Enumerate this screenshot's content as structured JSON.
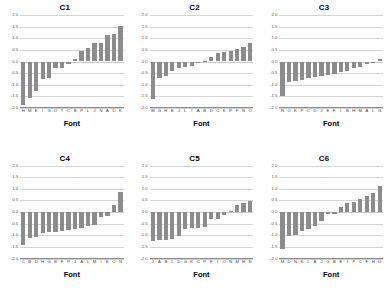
{
  "figure": {
    "background_color": "#ffffff",
    "bar_color": "#8c8c8c",
    "gridline_color": "#d4d4d4",
    "axis_color": "#8a8a8a"
  },
  "axis": {
    "xlabel": "Font",
    "ytick_labels": [
      "2.0",
      "1.5",
      "1.0",
      "0.5",
      "0.0",
      "-0.5",
      "-1.0",
      "-1.5",
      "-2.0"
    ],
    "ytick_values": [
      2.0,
      1.5,
      1.0,
      0.5,
      0.0,
      -0.5,
      -1.0,
      -1.5,
      -2.0
    ],
    "ylim": [
      -2.0,
      2.0
    ]
  },
  "chart_data": [
    {
      "type": "bar",
      "title": "C1",
      "xlabel": "Font",
      "ylabel": "",
      "ylim": [
        -2.0,
        2.0
      ],
      "grid": true,
      "categories": [
        "H",
        "M",
        "E",
        "I",
        "G",
        "O",
        "T",
        "C",
        "B",
        "P",
        "L",
        "J",
        "N",
        "A",
        "D",
        "K"
      ],
      "values": [
        -1.85,
        -1.55,
        -1.25,
        -0.75,
        -0.72,
        -0.3,
        -0.28,
        -0.1,
        0.12,
        0.45,
        0.6,
        0.78,
        0.8,
        1.15,
        1.18,
        1.52
      ]
    },
    {
      "type": "bar",
      "title": "C2",
      "xlabel": "Font",
      "ylabel": "",
      "ylim": [
        -2.0,
        2.0
      ],
      "grid": true,
      "categories": [
        "M",
        "G",
        "H",
        "E",
        "J",
        "L",
        "I",
        "A",
        "B",
        "D",
        "C",
        "K",
        "P",
        "F",
        "N",
        "O"
      ],
      "values": [
        -1.62,
        -0.72,
        -0.62,
        -0.4,
        -0.3,
        -0.22,
        -0.2,
        -0.02,
        0.04,
        0.18,
        0.36,
        0.4,
        0.44,
        0.52,
        0.62,
        0.78
      ]
    },
    {
      "type": "bar",
      "title": "C3",
      "xlabel": "Font",
      "ylabel": "",
      "ylim": [
        -2.0,
        2.0
      ],
      "grid": true,
      "categories": [
        "N",
        "O",
        "K",
        "P",
        "C",
        "D",
        "J",
        "E",
        "F",
        "I",
        "B",
        "H",
        "M",
        "A",
        "L",
        "G"
      ],
      "values": [
        -1.5,
        -0.88,
        -0.82,
        -0.78,
        -0.72,
        -0.68,
        -0.62,
        -0.58,
        -0.52,
        -0.46,
        -0.4,
        -0.3,
        -0.22,
        -0.12,
        -0.04,
        0.12
      ]
    },
    {
      "type": "bar",
      "title": "C4",
      "xlabel": "Font",
      "ylabel": "",
      "ylim": [
        -2.0,
        2.0
      ],
      "grid": true,
      "categories": [
        "C",
        "B",
        "D",
        "H",
        "G",
        "E",
        "F",
        "P",
        "J",
        "A",
        "L",
        "M",
        "I",
        "K",
        "O",
        "N"
      ],
      "values": [
        -1.42,
        -1.12,
        -1.08,
        -0.92,
        -0.88,
        -0.85,
        -0.82,
        -0.78,
        -0.72,
        -0.68,
        -0.62,
        -0.55,
        -0.22,
        -0.18,
        0.32,
        0.85
      ]
    },
    {
      "type": "bar",
      "title": "C5",
      "xlabel": "Font",
      "ylabel": "",
      "ylim": [
        -2.0,
        2.0
      ],
      "grid": true,
      "categories": [
        "J",
        "A",
        "B",
        "L",
        "D",
        "G",
        "K",
        "C",
        "P",
        "F",
        "I",
        "O",
        "N",
        "M",
        "H",
        "E"
      ],
      "values": [
        -1.25,
        -1.22,
        -1.2,
        -1.18,
        -1.05,
        -0.72,
        -0.7,
        -0.68,
        -0.65,
        -0.32,
        -0.28,
        -0.12,
        0.06,
        0.32,
        0.4,
        0.46
      ]
    },
    {
      "type": "bar",
      "title": "C6",
      "xlabel": "Font",
      "ylabel": "",
      "ylim": [
        -2.0,
        2.0
      ],
      "grid": true,
      "categories": [
        "M",
        "D",
        "N",
        "K",
        "L",
        "A",
        "J",
        "G",
        "B",
        "E",
        "I",
        "P",
        "C",
        "F",
        "H",
        "O"
      ],
      "values": [
        -1.58,
        -1.05,
        -0.98,
        -0.8,
        -0.72,
        -0.6,
        -0.4,
        -0.1,
        -0.08,
        0.22,
        0.38,
        0.45,
        0.58,
        0.7,
        0.82,
        1.12
      ]
    }
  ]
}
